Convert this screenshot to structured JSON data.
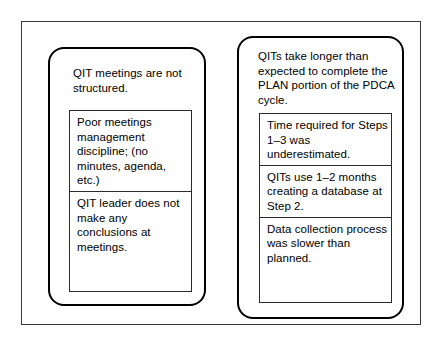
{
  "diagram": {
    "panels": [
      {
        "id": "qit-meetings-panel",
        "title": "QIT meetings are not structured.",
        "items": [
          "Poor meetings management discipline; (no minutes, agenda, etc.)",
          "QIT leader does not make any conclusions at meetings."
        ]
      },
      {
        "id": "plan-portion-panel",
        "title": "QITs take longer than expected to complete the PLAN portion of the PDCA cycle.",
        "items": [
          "Time required for Steps 1–3 was underestimated.",
          "QITs use 1–2 months creating a database at Step 2.",
          "Data collection process was slower than planned."
        ]
      }
    ]
  }
}
